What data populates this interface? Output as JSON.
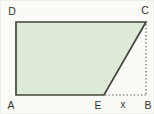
{
  "figure": {
    "vertex_labels": {
      "A": "A",
      "B": "B",
      "C": "C",
      "D": "D",
      "E": "E"
    },
    "segment_labels": {
      "x": "x"
    },
    "colors": {
      "background": "#fafaf7",
      "shape_fill": "#dcead7",
      "shape_stroke": "#43453d",
      "dotted_stroke": "#4c4c47",
      "label_text": "#35352f"
    }
  }
}
